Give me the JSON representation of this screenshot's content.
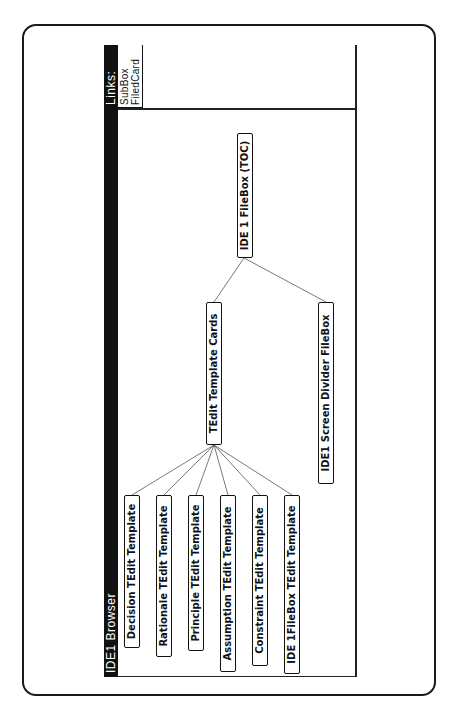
{
  "window": {
    "title": "IDE1 Browser"
  },
  "links_panel": {
    "title": "Links:",
    "items": [
      "SubBox",
      "FiledCard"
    ]
  },
  "tree": {
    "root": {
      "label": "IDE 1 FileBox (TOC)"
    },
    "children": [
      {
        "label": "TEdit Template Cards",
        "children": [
          {
            "label": "Decision TEdit Template"
          },
          {
            "label": "Rationale TEdit Template"
          },
          {
            "label": "Principle TEdit Template"
          },
          {
            "label": "Assumption TEdit Template"
          },
          {
            "label": "Constraint TEdit Template"
          },
          {
            "label": "IDE 1FileBox TEdit Template"
          }
        ]
      },
      {
        "label": "IDE1 Screen Divider FileBox"
      }
    ]
  },
  "colors": {
    "title_bar": "#111111",
    "title_text": "#ffffff",
    "node_border": "#111111",
    "link_line": "#555555"
  }
}
